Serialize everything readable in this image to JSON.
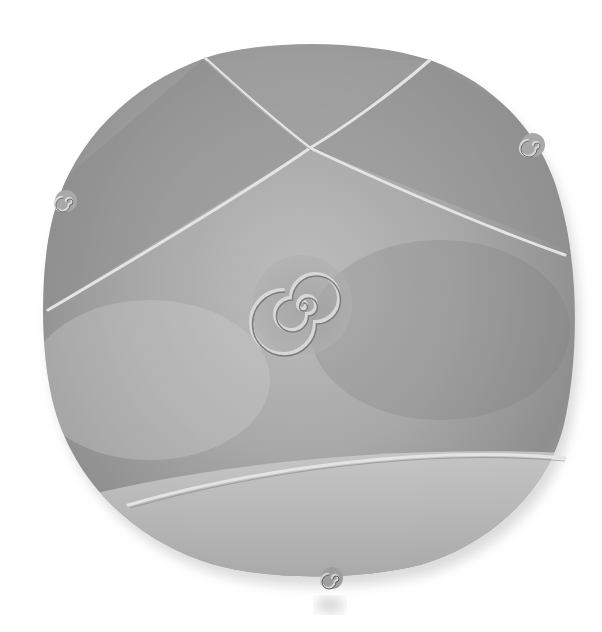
{
  "image": {
    "subject": "Round ceramic plate with incised crossing lines, central spiral, and three small coiled clay spiral feet",
    "alt": "Grey ceramic plate with spiral center and curled tabs",
    "colors": {
      "background": "#ffffff",
      "plate_light": "#d2d2d2",
      "plate_mid": "#a9a9a9",
      "plate_dark": "#6e6e6e",
      "line_highlight": "#e6e6e6"
    }
  }
}
